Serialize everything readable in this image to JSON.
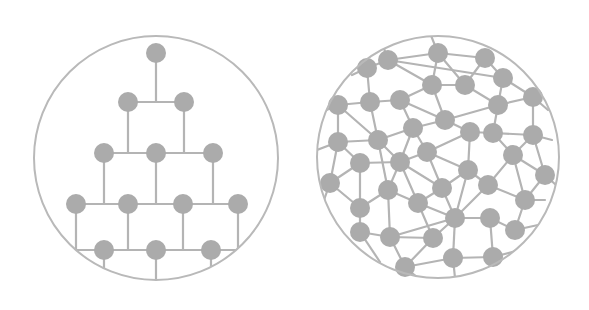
{
  "diagram": {
    "colors": {
      "background": "#ffffff",
      "stroke": "#b4b4b4",
      "node": "#ababab",
      "boundary": "#b9b9b9"
    },
    "node_radius": 10,
    "panels": [
      {
        "name": "hierarchical-network",
        "circle": {
          "cx": 156,
          "cy": 158,
          "r": 122
        },
        "nodes": [
          [
            156,
            53
          ],
          [
            128,
            102
          ],
          [
            184,
            102
          ],
          [
            104,
            153
          ],
          [
            156,
            153
          ],
          [
            213,
            153
          ],
          [
            76,
            204
          ],
          [
            128,
            204
          ],
          [
            183,
            204
          ],
          [
            238,
            204
          ],
          [
            104,
            250
          ],
          [
            156,
            250
          ],
          [
            211,
            250
          ]
        ],
        "segments": [
          [
            156,
            53,
            156,
            102
          ],
          [
            128,
            102,
            184,
            102
          ],
          [
            128,
            102,
            128,
            153
          ],
          [
            184,
            102,
            184,
            153
          ],
          [
            104,
            153,
            213,
            153
          ],
          [
            104,
            153,
            104,
            204
          ],
          [
            156,
            153,
            156,
            204
          ],
          [
            213,
            153,
            213,
            204
          ],
          [
            76,
            204,
            238,
            204
          ],
          [
            76,
            204,
            76,
            250
          ],
          [
            128,
            204,
            128,
            250
          ],
          [
            183,
            204,
            183,
            250
          ],
          [
            238,
            204,
            238,
            250
          ],
          [
            76,
            250,
            238,
            250
          ],
          [
            104,
            250,
            104,
            270
          ],
          [
            156,
            250,
            156,
            282
          ],
          [
            211,
            250,
            211,
            270
          ]
        ]
      },
      {
        "name": "distributed-network",
        "circle": {
          "cx": 438,
          "cy": 157,
          "r": 121
        },
        "nodes": [
          [
            367,
            68
          ],
          [
            388,
            60
          ],
          [
            438,
            53
          ],
          [
            485,
            58
          ],
          [
            503,
            78
          ],
          [
            432,
            85
          ],
          [
            465,
            85
          ],
          [
            533,
            97
          ],
          [
            338,
            105
          ],
          [
            370,
            102
          ],
          [
            400,
            100
          ],
          [
            498,
            105
          ],
          [
            445,
            120
          ],
          [
            413,
            128
          ],
          [
            470,
            132
          ],
          [
            493,
            133
          ],
          [
            533,
            135
          ],
          [
            338,
            142
          ],
          [
            378,
            140
          ],
          [
            427,
            152
          ],
          [
            400,
            162
          ],
          [
            360,
            163
          ],
          [
            513,
            155
          ],
          [
            468,
            170
          ],
          [
            545,
            175
          ],
          [
            330,
            183
          ],
          [
            388,
            190
          ],
          [
            442,
            188
          ],
          [
            488,
            185
          ],
          [
            525,
            200
          ],
          [
            418,
            203
          ],
          [
            360,
            208
          ],
          [
            455,
            218
          ],
          [
            490,
            218
          ],
          [
            360,
            232
          ],
          [
            390,
            237
          ],
          [
            433,
            238
          ],
          [
            515,
            230
          ],
          [
            405,
            267
          ],
          [
            453,
            258
          ],
          [
            493,
            257
          ]
        ],
        "edges": [
          [
            0,
            1
          ],
          [
            0,
            9
          ],
          [
            1,
            2
          ],
          [
            1,
            4
          ],
          [
            1,
            5
          ],
          [
            2,
            3
          ],
          [
            2,
            5
          ],
          [
            2,
            6
          ],
          [
            3,
            4
          ],
          [
            3,
            6
          ],
          [
            4,
            7
          ],
          [
            4,
            11
          ],
          [
            5,
            6
          ],
          [
            5,
            10
          ],
          [
            5,
            12
          ],
          [
            6,
            11
          ],
          [
            7,
            11
          ],
          [
            7,
            16
          ],
          [
            8,
            9
          ],
          [
            8,
            17
          ],
          [
            8,
            18
          ],
          [
            9,
            10
          ],
          [
            9,
            18
          ],
          [
            10,
            12
          ],
          [
            10,
            13
          ],
          [
            11,
            12
          ],
          [
            11,
            15
          ],
          [
            12,
            13
          ],
          [
            12,
            14
          ],
          [
            13,
            18
          ],
          [
            13,
            19
          ],
          [
            13,
            20
          ],
          [
            14,
            15
          ],
          [
            14,
            19
          ],
          [
            14,
            23
          ],
          [
            15,
            16
          ],
          [
            15,
            22
          ],
          [
            16,
            22
          ],
          [
            16,
            24
          ],
          [
            17,
            18
          ],
          [
            17,
            21
          ],
          [
            17,
            25
          ],
          [
            18,
            20
          ],
          [
            18,
            26
          ],
          [
            19,
            20
          ],
          [
            19,
            23
          ],
          [
            19,
            27
          ],
          [
            20,
            21
          ],
          [
            20,
            26
          ],
          [
            20,
            30
          ],
          [
            20,
            27
          ],
          [
            21,
            25
          ],
          [
            21,
            31
          ],
          [
            22,
            24
          ],
          [
            22,
            28
          ],
          [
            22,
            29
          ],
          [
            23,
            27
          ],
          [
            23,
            28
          ],
          [
            23,
            32
          ],
          [
            24,
            29
          ],
          [
            25,
            31
          ],
          [
            26,
            30
          ],
          [
            26,
            35
          ],
          [
            26,
            31
          ],
          [
            27,
            30
          ],
          [
            27,
            32
          ],
          [
            28,
            32
          ],
          [
            28,
            29
          ],
          [
            29,
            37
          ],
          [
            30,
            32
          ],
          [
            30,
            36
          ],
          [
            31,
            34
          ],
          [
            32,
            33
          ],
          [
            32,
            36
          ],
          [
            32,
            39
          ],
          [
            32,
            35
          ],
          [
            33,
            37
          ],
          [
            33,
            40
          ],
          [
            34,
            35
          ],
          [
            35,
            36
          ],
          [
            35,
            38
          ],
          [
            36,
            38
          ],
          [
            38,
            39
          ],
          [
            39,
            40
          ],
          [
            0,
            -1
          ],
          [
            1,
            -2
          ],
          [
            2,
            -3
          ],
          [
            8,
            -4
          ],
          [
            17,
            -5
          ],
          [
            25,
            -6
          ],
          [
            34,
            -7
          ],
          [
            38,
            -8
          ],
          [
            39,
            -9
          ],
          [
            40,
            -10
          ],
          [
            24,
            -11
          ],
          [
            7,
            -12
          ],
          [
            16,
            -13
          ],
          [
            37,
            -14
          ],
          [
            29,
            -15
          ]
        ],
        "boundary_anchors": [
          [
            352,
            75
          ],
          [
            380,
            37
          ],
          [
            430,
            33
          ],
          [
            322,
            112
          ],
          [
            317,
            150
          ],
          [
            324,
            200
          ],
          [
            380,
            262
          ],
          [
            418,
            278
          ],
          [
            455,
            278
          ],
          [
            520,
            250
          ],
          [
            556,
            185
          ],
          [
            548,
            110
          ],
          [
            552,
            140
          ],
          [
            538,
            225
          ],
          [
            545,
            200
          ]
        ]
      }
    ]
  }
}
